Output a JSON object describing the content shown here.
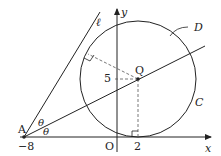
{
  "diagram": {
    "labels": {
      "y_axis": "y",
      "x_axis": "x",
      "origin": "O",
      "A": "A",
      "A_coord": "−8",
      "Q": "Q",
      "Q_y": "5",
      "Q_x": "2",
      "line": "ℓ",
      "region": "D",
      "circle": "C",
      "theta_upper": "θ",
      "theta_lower": "θ"
    },
    "points": {
      "A": [
        -8,
        0
      ],
      "O": [
        0,
        0
      ],
      "Q": [
        2,
        5
      ],
      "tangent_x": [
        2,
        0
      ]
    },
    "circle": {
      "center": [
        2,
        5
      ],
      "radius": 5
    },
    "colors": {
      "stroke": "#222222",
      "dashed": "#555555",
      "background": "#ffffff"
    }
  }
}
